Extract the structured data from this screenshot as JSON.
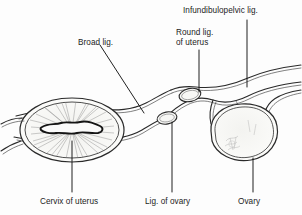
{
  "figure": {
    "kind": "anatomical-diagram",
    "background_color": "#fdfdfd",
    "ink_color": "#1c1c1c",
    "fill_tint": "#f4f4f2"
  },
  "labels": {
    "infundibulopelvic": "Infundibulopelvic lig.",
    "round_lig_line1": "Round lig.",
    "round_lig_line2": "of uterus",
    "broad_lig": "Broad lig.",
    "cervix": "Cervix of uterus",
    "lig_of_ovary": "Lig. of ovary",
    "ovary": "Ovary"
  },
  "structures": [
    {
      "name": "cervix-of-uterus",
      "shape": "ellipse-with-striations-and-os"
    },
    {
      "name": "broad-ligament",
      "shape": "band"
    },
    {
      "name": "round-ligament-of-uterus",
      "shape": "small-oval"
    },
    {
      "name": "ligament-of-ovary",
      "shape": "small-oval"
    },
    {
      "name": "ovary",
      "shape": "rounded-irregular"
    },
    {
      "name": "infundibulopelvic-ligament",
      "shape": "band"
    }
  ],
  "leaders": [
    {
      "name": "leader-infundibulopelvic",
      "type": "vertical"
    },
    {
      "name": "leader-round-ligament",
      "type": "vertical"
    },
    {
      "name": "leader-broad-ligament",
      "type": "diagonal"
    },
    {
      "name": "leader-cervix",
      "type": "vertical"
    },
    {
      "name": "leader-lig-of-ovary",
      "type": "vertical"
    },
    {
      "name": "leader-ovary",
      "type": "vertical"
    }
  ]
}
